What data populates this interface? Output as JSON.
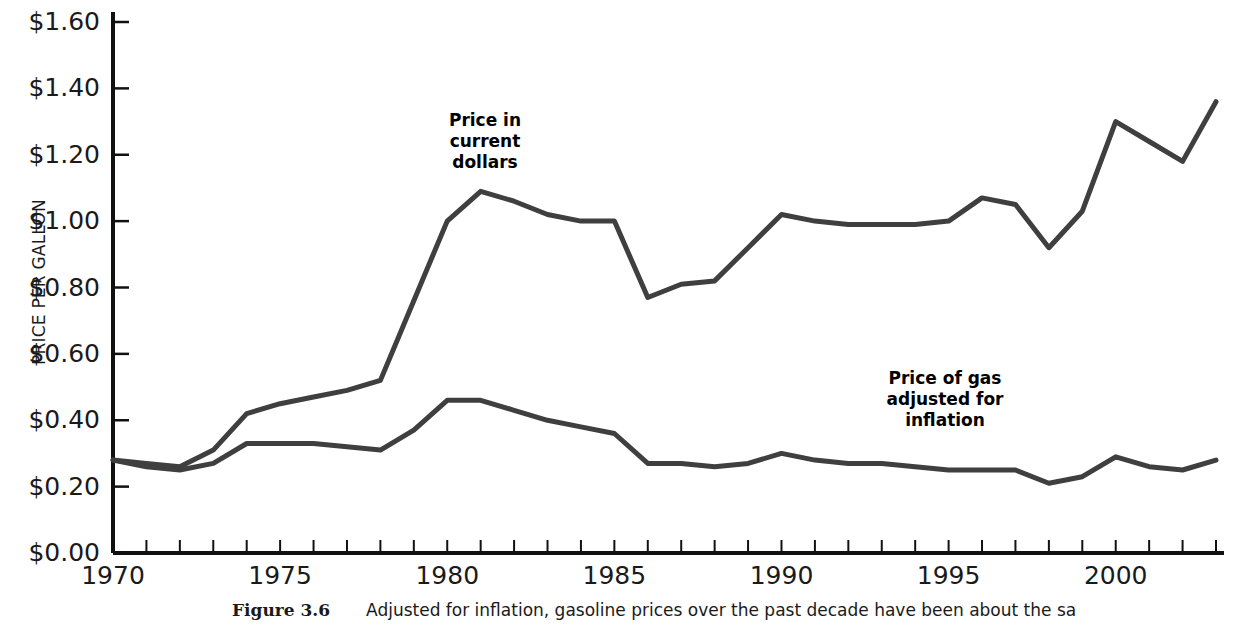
{
  "figure": {
    "caption_label": "Figure 3.6",
    "caption_text": "Adjusted for inflation, gasoline prices over the past decade have been about the sa"
  },
  "chart_data": {
    "type": "line",
    "title": "",
    "xlabel": "",
    "ylabel": "PRICE PER GALLON",
    "xlim": [
      1970,
      2003
    ],
    "ylim": [
      0.0,
      1.6
    ],
    "grid": false,
    "legend": "annotations-on-plot",
    "x": [
      1970,
      1971,
      1972,
      1973,
      1974,
      1975,
      1976,
      1977,
      1978,
      1979,
      1980,
      1981,
      1982,
      1983,
      1984,
      1985,
      1986,
      1987,
      1988,
      1989,
      1990,
      1991,
      1992,
      1993,
      1994,
      1995,
      1996,
      1997,
      1998,
      1999,
      2000,
      2001,
      2002,
      2003
    ],
    "x_tick_labels": [
      "1970",
      "1975",
      "1980",
      "1985",
      "1990",
      "1995",
      "2000"
    ],
    "x_tick_values": [
      1970,
      1975,
      1980,
      1985,
      1990,
      1995,
      2000
    ],
    "y_tick_labels": [
      "$0.00",
      "$0.20",
      "$0.40",
      "$0.60",
      "$0.80",
      "$1.00",
      "$1.20",
      "$1.40",
      "$1.60"
    ],
    "y_tick_values": [
      0.0,
      0.2,
      0.4,
      0.6,
      0.8,
      1.0,
      1.2,
      1.4,
      1.6
    ],
    "series": [
      {
        "name": "Price in current dollars",
        "annotation": "Price in\ncurrent\ndollars",
        "color": "#3f3f3f",
        "values": [
          0.28,
          0.27,
          0.26,
          0.31,
          0.42,
          0.45,
          0.47,
          0.49,
          0.52,
          0.76,
          1.0,
          1.09,
          1.06,
          1.02,
          1.0,
          1.0,
          0.77,
          0.81,
          0.82,
          0.92,
          1.02,
          1.0,
          0.99,
          0.99,
          0.99,
          1.0,
          1.07,
          1.05,
          0.92,
          1.03,
          1.3,
          1.24,
          1.18,
          1.36
        ]
      },
      {
        "name": "Price of gas adjusted for inflation",
        "annotation": "Price of gas\nadjusted for\ninflation",
        "color": "#3f3f3f",
        "values": [
          0.28,
          0.26,
          0.25,
          0.27,
          0.33,
          0.33,
          0.33,
          0.32,
          0.31,
          0.37,
          0.46,
          0.46,
          0.43,
          0.4,
          0.38,
          0.36,
          0.27,
          0.27,
          0.26,
          0.27,
          0.3,
          0.28,
          0.27,
          0.27,
          0.26,
          0.25,
          0.25,
          0.25,
          0.21,
          0.23,
          0.29,
          0.26,
          0.25,
          0.28
        ]
      }
    ]
  }
}
